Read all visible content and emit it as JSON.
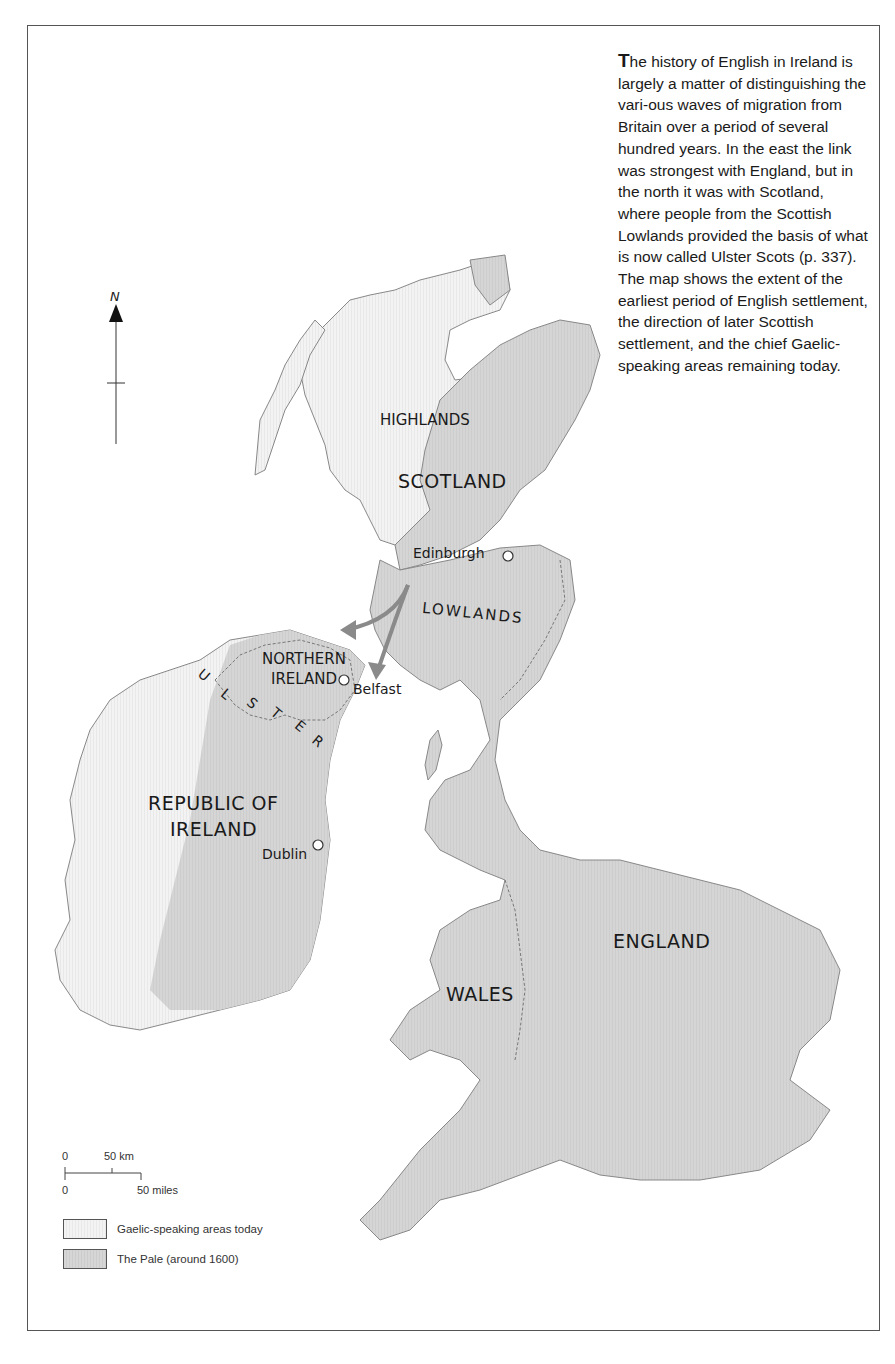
{
  "caption": {
    "dropcap": "T",
    "text": "he history of English in Ireland is largely a matter of distinguishing the vari-ous waves of migration from Britain over a period of several hundred years. In the east the link was strongest with England, but in the north it was with Scotland, where people from the Scottish Lowlands provided the basis of what is now called Ulster Scots (p. 337). The map shows the extent of the earliest period of English settlement, the direction of later Scottish settlement, and the chief Gaelic-speaking areas remaining today."
  },
  "compass": {
    "label": "N",
    "icon": "north-arrow-icon"
  },
  "regions": {
    "highlands": "HIGHLANDS",
    "scotland": "SCOTLAND",
    "lowlands": "LOWLANDS",
    "northern_ireland_1": "NORTHERN",
    "northern_ireland_2": "IRELAND",
    "ulster_letters": [
      "U",
      "L",
      "S",
      "T",
      "E",
      "R"
    ],
    "republic_1": "REPUBLIC OF",
    "republic_2": "IRELAND",
    "wales": "WALES",
    "england": "ENGLAND"
  },
  "cities": {
    "edinburgh": "Edinburgh",
    "belfast": "Belfast",
    "dublin": "Dublin"
  },
  "scale_bar": {
    "km_zero": "0",
    "km_label": "50 km",
    "mi_zero": "0",
    "mi_label": "50 miles"
  },
  "legend": [
    {
      "label": "Gaelic-speaking areas today",
      "color": "#f0f0f0"
    },
    {
      "label": "The Pale (around 1600)",
      "color": "#d4d4d4"
    }
  ],
  "colors": {
    "land_pale": "#d4d4d4",
    "land_gaelic": "#f0f0f0",
    "coast": "#7a7a7a",
    "arrow": "#8a8a8a"
  }
}
